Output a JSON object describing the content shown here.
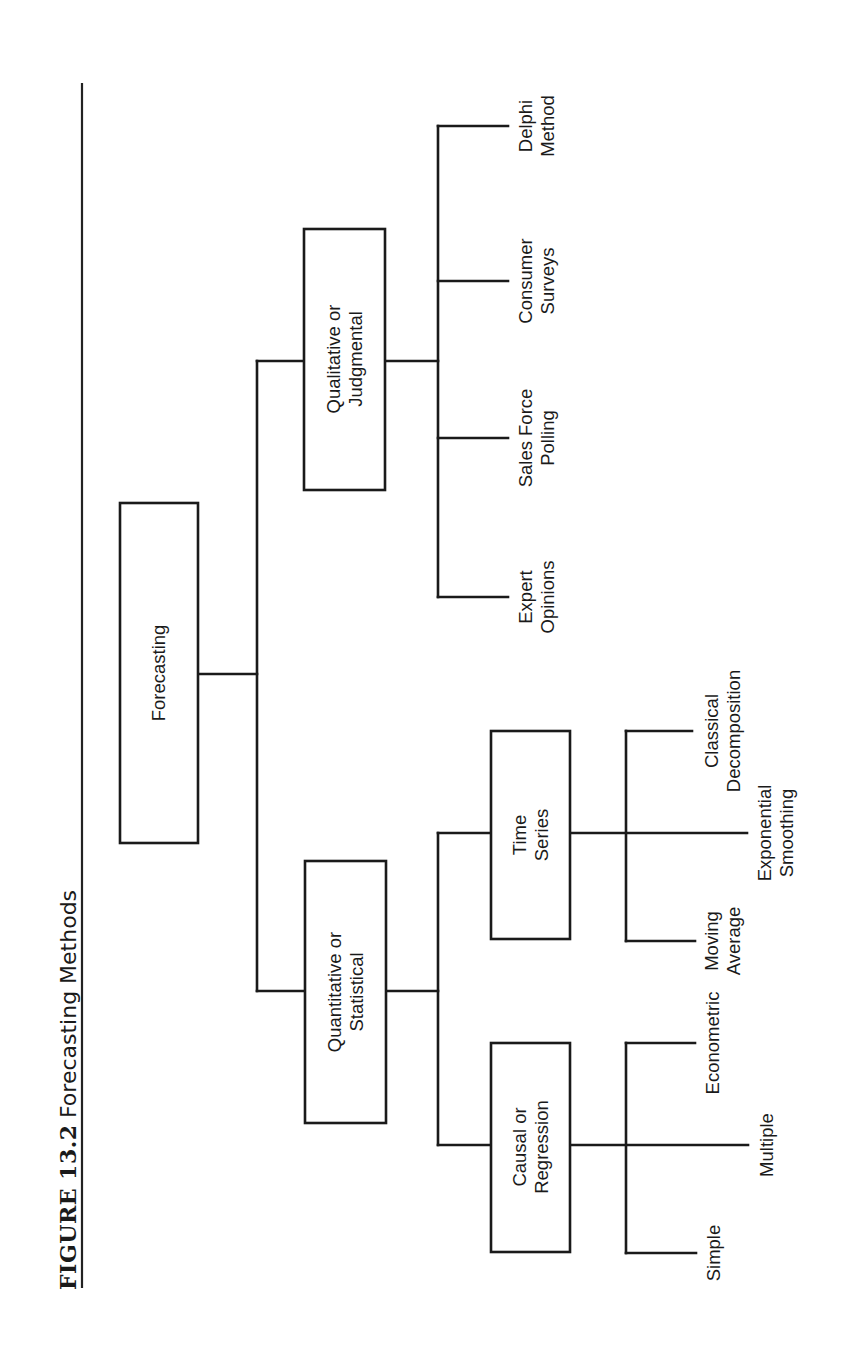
{
  "figure": {
    "number": "FIGURE 13.2",
    "title": "Forecasting Methods",
    "orientation": "rotated-90-ccw"
  },
  "tree": {
    "root": {
      "label": "Forecasting"
    },
    "branches": [
      {
        "label_lines": [
          "Quantitative or",
          "Statistical"
        ],
        "children": [
          {
            "label_lines": [
              "Causal or",
              "Regression"
            ],
            "leaves": [
              {
                "label_lines": [
                  "Simple"
                ]
              },
              {
                "label_lines": [
                  "Multiple"
                ]
              },
              {
                "label_lines": [
                  "Econometric"
                ]
              }
            ]
          },
          {
            "label_lines": [
              "Time",
              "Series"
            ],
            "leaves": [
              {
                "label_lines": [
                  "Moving",
                  "Average"
                ]
              },
              {
                "label_lines": [
                  "Exponential",
                  "Smoothing"
                ]
              },
              {
                "label_lines": [
                  "Classical",
                  "Decomposition"
                ]
              }
            ]
          }
        ]
      },
      {
        "label_lines": [
          "Qualitative or",
          "Judgmental"
        ],
        "leaves": [
          {
            "label_lines": [
              "Expert",
              "Opinions"
            ]
          },
          {
            "label_lines": [
              "Sales Force",
              "Polling"
            ]
          },
          {
            "label_lines": [
              "Consumer",
              "Surveys"
            ]
          },
          {
            "label_lines": [
              "Delphi",
              "Method"
            ]
          }
        ]
      }
    ]
  }
}
